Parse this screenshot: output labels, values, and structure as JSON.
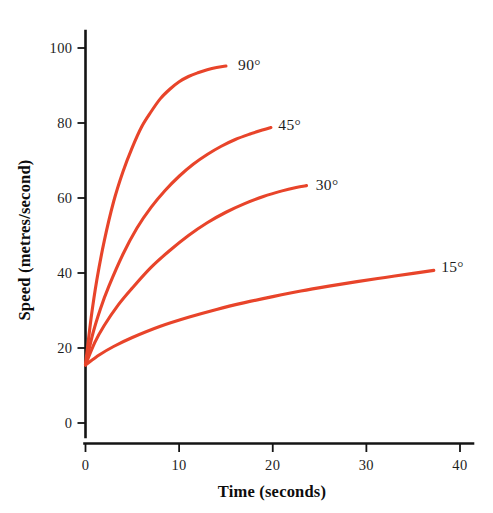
{
  "chart_data": {
    "type": "line",
    "title": "",
    "xlabel": "Time (seconds)",
    "ylabel": "Speed (metres/second)",
    "xlim": [
      0,
      41
    ],
    "ylim": [
      0,
      103
    ],
    "xticks": [
      0,
      10,
      20,
      30,
      40
    ],
    "xtick_labels": [
      "0",
      "10",
      "20",
      "30",
      "40"
    ],
    "yticks": [
      0,
      20,
      40,
      60,
      80,
      100
    ],
    "ytick_labels": [
      "0",
      "20",
      "40",
      "60",
      "80",
      "100"
    ],
    "grid": false,
    "legend_position": "inline-end-of-line",
    "line_color": "#e8442a",
    "axis_color": "#141414",
    "background": "#ffffff",
    "series": [
      {
        "name": "90°",
        "label": "90°",
        "color": "#e8442a",
        "label_x": 16.3,
        "label_y": 95.5,
        "x": [
          0.0,
          0.6,
          1.2,
          2.0,
          3.0,
          4.0,
          5.0,
          6.0,
          7.0,
          8.0,
          9.0,
          10.0,
          11.0,
          12.0,
          13.0,
          14.0,
          15.0
        ],
        "y": [
          15.5,
          28.0,
          38.0,
          48.5,
          59.0,
          67.0,
          73.5,
          79.0,
          83.0,
          86.5,
          89.0,
          91.0,
          92.4,
          93.4,
          94.2,
          94.8,
          95.2
        ]
      },
      {
        "name": "45°",
        "label": "45°",
        "color": "#e8442a",
        "label_x": 20.6,
        "label_y": 79.5,
        "x": [
          0.0,
          0.8,
          1.6,
          2.5,
          4.0,
          5.5,
          7.0,
          8.5,
          10.0,
          11.5,
          13.0,
          14.5,
          16.0,
          17.5,
          19.0,
          19.8
        ],
        "y": [
          15.5,
          24.0,
          30.5,
          36.5,
          45.0,
          52.0,
          57.5,
          62.0,
          65.8,
          69.0,
          71.6,
          73.8,
          75.6,
          77.0,
          78.2,
          78.8
        ]
      },
      {
        "name": "30°",
        "label": "30°",
        "color": "#e8442a",
        "label_x": 24.6,
        "label_y": 63.5,
        "x": [
          0.0,
          1.0,
          2.0,
          3.5,
          5.0,
          7.0,
          9.0,
          11.0,
          13.0,
          15.0,
          17.0,
          19.0,
          21.0,
          22.5,
          23.6
        ],
        "y": [
          15.5,
          21.5,
          26.0,
          31.5,
          36.0,
          41.5,
          46.0,
          50.0,
          53.4,
          56.2,
          58.5,
          60.4,
          61.9,
          62.8,
          63.3
        ]
      },
      {
        "name": "15°",
        "label": "15°",
        "color": "#e8442a",
        "label_x": 38.0,
        "label_y": 41.5,
        "x": [
          0.0,
          1.5,
          3.0,
          5.0,
          8.0,
          11.0,
          14.0,
          17.0,
          20.0,
          23.0,
          26.0,
          29.0,
          32.0,
          35.0,
          37.2
        ],
        "y": [
          15.5,
          18.2,
          20.4,
          22.8,
          25.8,
          28.2,
          30.3,
          32.1,
          33.7,
          35.2,
          36.5,
          37.7,
          38.8,
          39.9,
          40.7
        ]
      }
    ]
  }
}
